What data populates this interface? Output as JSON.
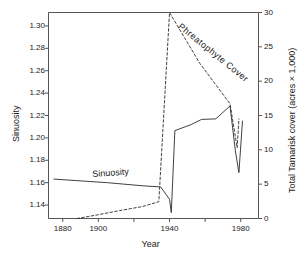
{
  "chart_data": {
    "type": "line",
    "title": "",
    "xlabel": "Year",
    "ylabel": "Sinuosity",
    "ylabel_right": "Total Tamarisk cover (acres × 1,000)",
    "xlim": [
      1872,
      1990
    ],
    "ylim": [
      1.128,
      1.312
    ],
    "ylim_right": [
      0,
      30
    ],
    "grid": false,
    "legend": "inline-labels",
    "xticks": [
      1880,
      1900,
      1920,
      1940,
      1960,
      1980
    ],
    "xtick_labels": [
      "1880",
      "1900",
      "",
      "1940",
      "",
      "1980"
    ],
    "yticks": [
      1.14,
      1.16,
      1.18,
      1.2,
      1.22,
      1.24,
      1.26,
      1.28,
      1.3
    ],
    "ytick_labels": [
      "1.14",
      "1.16",
      "1.18",
      "1.20",
      "1.22",
      "1.24",
      "1.26",
      "1.28",
      "1.30"
    ],
    "yticks_right": [
      0,
      5,
      10,
      15,
      20,
      25,
      30
    ],
    "ytick_labels_right": [
      "0",
      "5",
      "10",
      "15",
      "20",
      "25",
      "30"
    ],
    "series": [
      {
        "name": "Sinuosity",
        "axis": "left",
        "style": "solid",
        "color": "#2b2b2b",
        "label_text": "Sinuosity",
        "x": [
          1875,
          1905,
          1925,
          1935,
          1940,
          1941,
          1943,
          1952,
          1958,
          1966,
          1974,
          1977,
          1979,
          1981
        ],
        "y": [
          1.1632,
          1.16,
          1.1572,
          1.1562,
          1.1452,
          1.1333,
          1.2065,
          1.2118,
          1.2165,
          1.217,
          1.2285,
          1.1885,
          1.169,
          1.215
        ]
      },
      {
        "name": "Phreatophyte Cover",
        "axis": "right",
        "style": "dashed",
        "color": "#2b2b2b",
        "label_text": "Phreatophyte Cover",
        "x": [
          1888,
          1900,
          1912,
          1925,
          1934,
          1940,
          1957,
          1974,
          1978,
          1979
        ],
        "y": [
          0.0,
          0.55,
          1.15,
          1.75,
          2.45,
          30.0,
          22.6,
          16.7,
          10.3,
          14.5
        ]
      }
    ]
  },
  "axes": {
    "x_title": "Year",
    "y_left_title": "Sinuosity",
    "y_right_title": "Total Tamarisk cover (acres × 1,000)"
  },
  "labels": {
    "sinuosity": "Sinuosity",
    "phreatophyte": "Phreatophyte Cover"
  },
  "colors": {
    "line": "#2b2b2b",
    "axis": "#555555",
    "text": "#1a1a1a",
    "background": "#ffffff"
  }
}
